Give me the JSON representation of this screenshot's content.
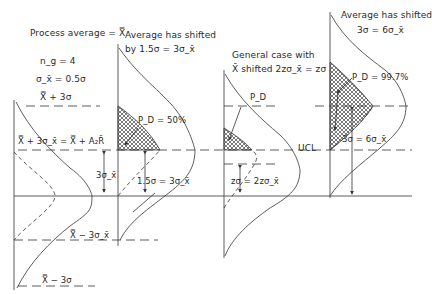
{
  "figure": {
    "panel1": {
      "title": "Process average = X̿",
      "n_label": "n_g = 4",
      "sigma_label": "σ_x̄ = 0.5σ",
      "upper3sigma_label": "X̿ + 3σ",
      "ucl_label": "X̿ + 3σ_x̄ = X̿ + A₂R̄",
      "gap_label": "3σ_x̄",
      "lcl_label": "X̿ − 3σ_x̄",
      "lower3sigma_label": "X̿ − 3σ"
    },
    "panel2": {
      "title_line1": "Average has shifted",
      "title_line2": "by 1.5σ = 3σ_x̄",
      "pd_label": "P_D = 50%",
      "shift_label": "1.5σ = 3σ_x̄"
    },
    "panel3": {
      "title_line1": "General case with",
      "title_line2": "X̄ shifted 2zσ_x̄ = zσ",
      "pd_label": "P_D",
      "ucl_label": "UCL",
      "shift_label": "zσ = 2zσ_x̄"
    },
    "panel4": {
      "title_line1": "Average has shifted",
      "title_line2": "3σ = 6σ_x̄",
      "pd_label": "P_D = 99.7%",
      "shift_label": "3σ = 6σ_x̄"
    },
    "colors": {
      "line": "#333333",
      "hatch": "#444444",
      "background": "#ffffff"
    }
  }
}
